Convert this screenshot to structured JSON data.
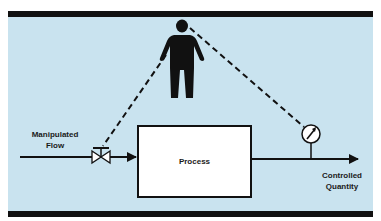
{
  "diagram": {
    "type": "manual process control",
    "colors": {
      "background": "#c9e3ef",
      "bars": "#111111",
      "lines": "#111111",
      "box_fill": "#ffffff"
    },
    "labels": {
      "input": [
        "Manipulated",
        "Flow"
      ],
      "process": "Process",
      "output": [
        "Controlled",
        "Quantity"
      ]
    },
    "elements": [
      {
        "name": "operator",
        "icon": "person-icon"
      },
      {
        "name": "valve",
        "icon": "valve-icon"
      },
      {
        "name": "gauge",
        "icon": "gauge-icon"
      },
      {
        "name": "process",
        "shape": "box"
      }
    ],
    "connections": [
      {
        "from": "Manipulated Flow",
        "to": "valve",
        "style": "solid"
      },
      {
        "from": "valve",
        "to": "process",
        "style": "solid-arrow"
      },
      {
        "from": "process",
        "to": "Controlled Quantity",
        "style": "solid-arrow"
      },
      {
        "from": "operator",
        "to": "valve",
        "style": "dashed"
      },
      {
        "from": "gauge",
        "to": "operator",
        "style": "dashed"
      }
    ]
  }
}
